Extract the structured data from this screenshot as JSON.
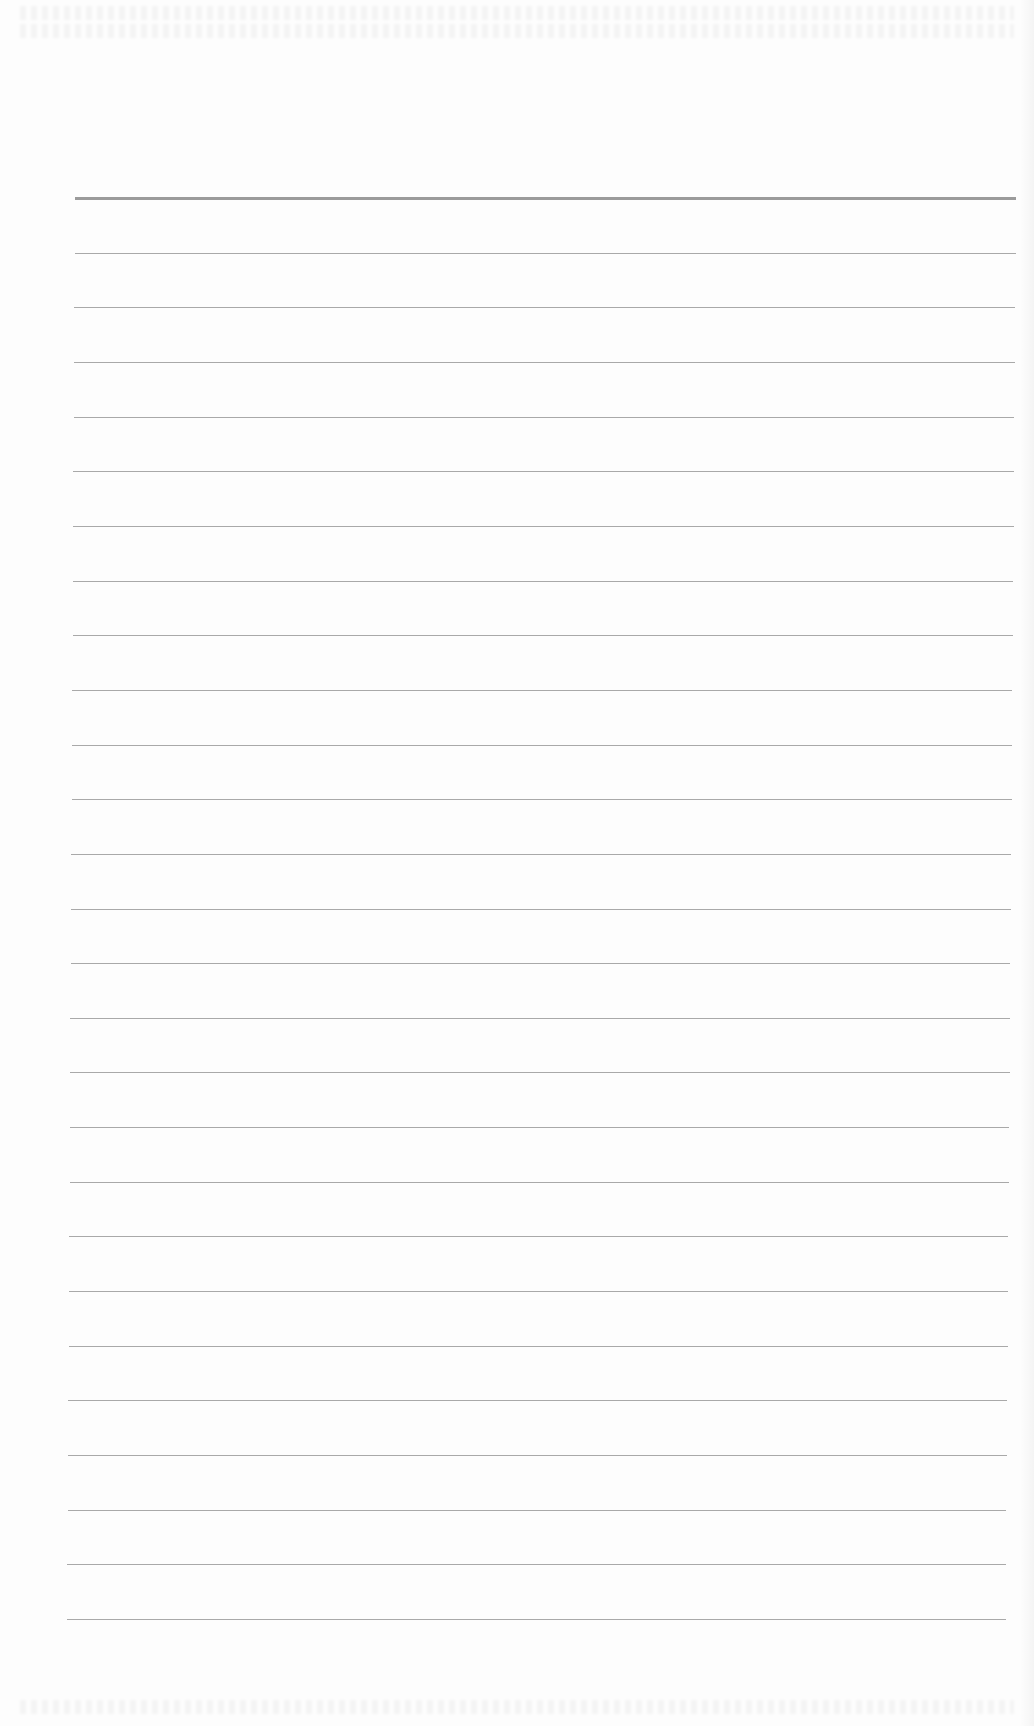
{
  "page": {
    "type": "blank lined paper",
    "background_color": "#fdfdfd",
    "rule_color": "#9a9a9a"
  },
  "rules": {
    "count": 27,
    "first_y": 198,
    "last_y": 1619,
    "left_x": 75,
    "right_x": 1016
  }
}
